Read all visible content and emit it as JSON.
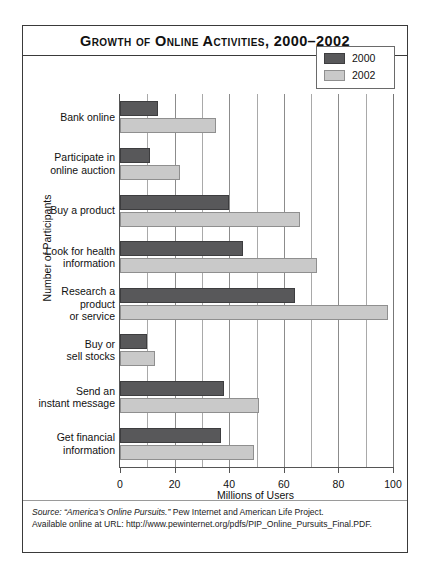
{
  "title": "Growth of Online Activities, 2000–2002",
  "axes": {
    "x_title": "Millions of Users",
    "y_title": "Number of Participants"
  },
  "legend": {
    "entries": [
      {
        "label": "2000",
        "color": "#58585a"
      },
      {
        "label": "2002",
        "color": "#c9c9c9"
      }
    ]
  },
  "source": {
    "line1_italic": "Source: “America’s Online Pursuits.”",
    "line1_rest": " Pew Internet and American Life Project.",
    "line2": "Available online at URL: http://www.pewinternet.org/pdfs/PIP_Online_Pursuits_Final.PDF."
  },
  "chart_data": {
    "type": "bar",
    "orientation": "horizontal",
    "title": "Growth of Online Activities, 2000–2002",
    "xlabel": "Millions of Users",
    "ylabel": "Number of Participants",
    "xlim": [
      0,
      100
    ],
    "xticks": [
      0,
      20,
      40,
      60,
      80,
      100
    ],
    "xtick_labels": [
      "0",
      "20",
      "40",
      "60",
      "80",
      "100"
    ],
    "minor_gridlines": [
      10,
      30,
      50,
      70,
      90
    ],
    "grid": true,
    "legend_position": "top-right",
    "categories": [
      "Bank online",
      "Participate in\nonline auction",
      "Buy a product",
      "Look for health\ninformation",
      "Research a\nproduct\nor service",
      "Buy or\nsell stocks",
      "Send an\ninstant message",
      "Get financial\ninformation"
    ],
    "series": [
      {
        "name": "2000",
        "color": "#58585a",
        "values": [
          14,
          11,
          40,
          45,
          64,
          10,
          38,
          37
        ]
      },
      {
        "name": "2002",
        "color": "#c9c9c9",
        "values": [
          35,
          22,
          66,
          72,
          98,
          13,
          51,
          49
        ]
      }
    ]
  }
}
